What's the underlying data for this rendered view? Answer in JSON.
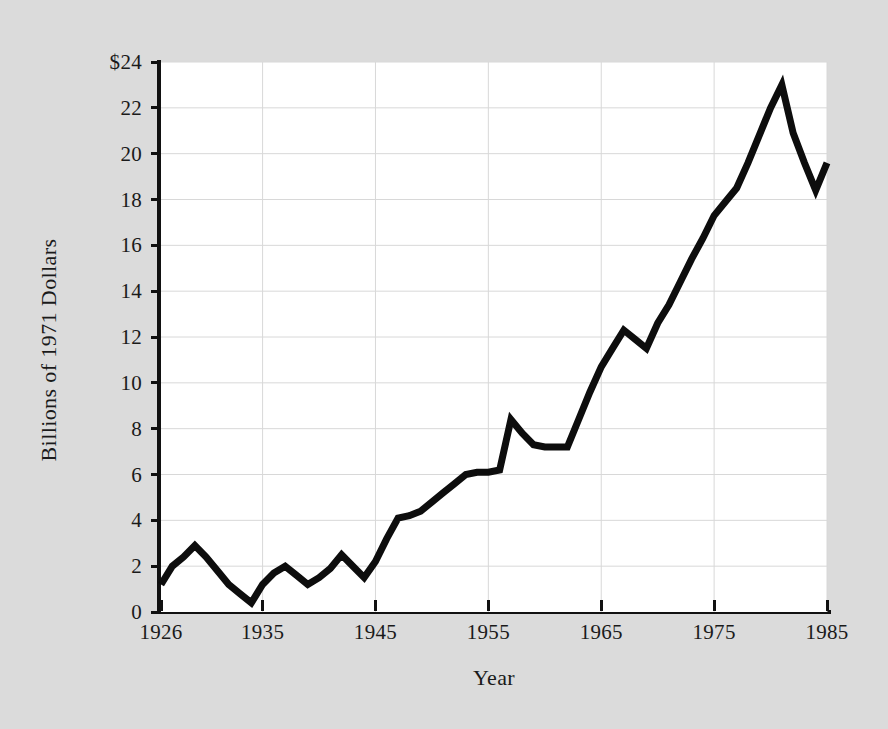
{
  "chart_data": {
    "type": "line",
    "title": "",
    "xlabel": "Year",
    "ylabel": "Billions of 1971 Dollars",
    "xlim": [
      1926,
      1985
    ],
    "ylim": [
      0,
      24
    ],
    "grid": true,
    "legend": null,
    "y_tick_labels": [
      "$24",
      "22",
      "20",
      "18",
      "16",
      "14",
      "12",
      "10",
      "8",
      "6",
      "4",
      "2",
      "0"
    ],
    "y_tick_values": [
      24,
      22,
      20,
      18,
      16,
      14,
      12,
      10,
      8,
      6,
      4,
      2,
      0
    ],
    "x_tick_labels": [
      "1926",
      "1935",
      "1945",
      "1955",
      "1965",
      "1975",
      "1985"
    ],
    "x_tick_values": [
      1926,
      1935,
      1945,
      1955,
      1965,
      1975,
      1985
    ],
    "series": [
      {
        "name": "Billions of 1971 Dollars",
        "color": "#0d0d0d",
        "x": [
          1926,
          1927,
          1928,
          1929,
          1930,
          1931,
          1932,
          1933,
          1934,
          1935,
          1936,
          1937,
          1938,
          1939,
          1940,
          1941,
          1942,
          1943,
          1944,
          1945,
          1946,
          1947,
          1948,
          1949,
          1950,
          1951,
          1952,
          1953,
          1954,
          1955,
          1956,
          1957,
          1958,
          1959,
          1960,
          1961,
          1962,
          1963,
          1964,
          1965,
          1966,
          1967,
          1968,
          1969,
          1970,
          1971,
          1972,
          1973,
          1974,
          1975,
          1976,
          1977,
          1978,
          1979,
          1980,
          1981,
          1982,
          1983,
          1984,
          1985
        ],
        "values": [
          1.2,
          2.0,
          2.4,
          2.9,
          2.4,
          1.8,
          1.2,
          0.8,
          0.4,
          1.2,
          1.7,
          2.0,
          1.6,
          1.2,
          1.5,
          1.9,
          2.5,
          2.0,
          1.5,
          2.2,
          3.2,
          4.1,
          4.2,
          4.4,
          4.8,
          5.2,
          5.6,
          6.0,
          6.1,
          6.1,
          6.2,
          8.4,
          7.8,
          7.3,
          7.2,
          7.2,
          7.2,
          8.4,
          9.6,
          10.7,
          11.5,
          12.3,
          11.9,
          11.5,
          12.6,
          13.4,
          14.4,
          15.4,
          16.3,
          17.3,
          17.9,
          18.5,
          19.6,
          20.8,
          22.0,
          23.0,
          20.9,
          19.6,
          18.4,
          19.6
        ]
      }
    ]
  },
  "axis": {
    "y_title": "Billions of 1971 Dollars",
    "x_title": "Year"
  }
}
